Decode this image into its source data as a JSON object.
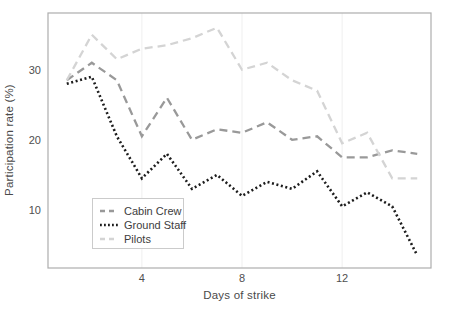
{
  "chart_data": {
    "type": "line",
    "title": "",
    "xlabel": "Days of strike",
    "ylabel": "Participation rate (%)",
    "x": [
      1,
      2,
      3,
      4,
      5,
      6,
      7,
      8,
      9,
      10,
      11,
      12,
      13,
      14,
      15
    ],
    "xticks": [
      4,
      8,
      12
    ],
    "yticks": [
      10,
      20,
      30
    ],
    "xlim": [
      0.25,
      15.55
    ],
    "ylim": [
      1.7,
      38.1
    ],
    "grid": "very faint vertical gridlines at x ticks",
    "legend_position": "inside lower-left, boxed",
    "series": [
      {
        "name": "Cabin Crew",
        "style": "dashed",
        "color": "#999999",
        "values": [
          28.5,
          31,
          28.5,
          20.5,
          26,
          20,
          21.5,
          21,
          22.5,
          20,
          20.5,
          17.5,
          17.5,
          18.5,
          18
        ]
      },
      {
        "name": "Ground Staff",
        "style": "dotted",
        "color": "#1c1c1c",
        "values": [
          28,
          29,
          20.5,
          14.5,
          18,
          13,
          15,
          12,
          14,
          13,
          15.5,
          10.5,
          12.5,
          10.5,
          3.5
        ]
      },
      {
        "name": "Pilots",
        "style": "dashed",
        "color": "#d4d4d4",
        "values": [
          28.5,
          35,
          31.5,
          33,
          33.5,
          34.5,
          36,
          30,
          31,
          28.5,
          27,
          19.5,
          21,
          14.5,
          14.5
        ]
      }
    ],
    "colors": {
      "background": "#ffffff",
      "frame": "#adadad",
      "grid": "#efefef",
      "tick_text": "#4f4f4f"
    }
  }
}
